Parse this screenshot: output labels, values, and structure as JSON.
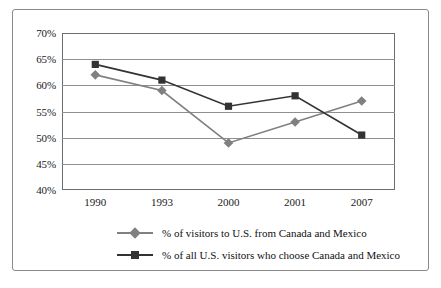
{
  "chart_data": {
    "type": "line",
    "title": "",
    "xlabel": "",
    "ylabel": "",
    "categories": [
      "1990",
      "1993",
      "2000",
      "2001",
      "2007"
    ],
    "ylim": [
      40,
      70
    ],
    "yticks": [
      "40%",
      "45%",
      "50%",
      "55%",
      "60%",
      "65%",
      "70%"
    ],
    "ytick_values": [
      40,
      45,
      50,
      55,
      60,
      65,
      70
    ],
    "grid": true,
    "legend_position": "bottom",
    "series": [
      {
        "name": "% of visitors to U.S. from Canada and Mexico",
        "marker": "diamond",
        "color": "#808080",
        "values": [
          62,
          59,
          49,
          53,
          57
        ]
      },
      {
        "name": "% of all U.S. visitors who choose Canada and Mexico",
        "marker": "square",
        "color": "#333333",
        "values": [
          64,
          61,
          56,
          58,
          50.5
        ]
      }
    ]
  },
  "legend": {
    "items": [
      {
        "label": "% of visitors to U.S. from Canada and Mexico"
      },
      {
        "label": "% of all U.S. visitors who choose Canada and Mexico"
      }
    ]
  }
}
